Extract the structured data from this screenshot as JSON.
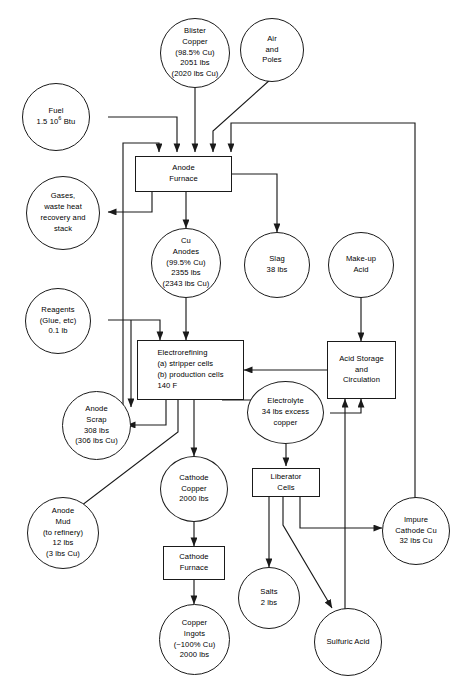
{
  "diagram": {
    "stroke_color": "#1a1a1a",
    "background_color": "#ffffff"
  },
  "nodes": {
    "blister_copper": {
      "label": "Blister\nCopper\n(98.5% Cu)\n2051 lbs\n(2020 lbs Cu)",
      "shape": "circle"
    },
    "air_and_poles": {
      "label": "Air\nand\nPoles",
      "shape": "circle"
    },
    "fuel": {
      "label_line1": "Fuel",
      "label_line2_pre": "1.5 10",
      "label_line2_sup": "6",
      "label_line2_post": " Btu",
      "shape": "circle"
    },
    "gases_waste_heat": {
      "label": "Gases,\nwaste heat\nrecovery and\nstack",
      "shape": "circle"
    },
    "anode_furnace": {
      "label": "Anode\nFurnace",
      "shape": "box"
    },
    "cu_anodes": {
      "label": "Cu\nAnodes\n(99.5% Cu)\n2355 lbs\n(2343 lbs Cu)",
      "shape": "circle"
    },
    "slag": {
      "label": "Slag\n38 lbs",
      "shape": "circle"
    },
    "make_up_acid": {
      "label": "Make-up\nAcid",
      "shape": "circle"
    },
    "reagents": {
      "label": "Reagents\n(Glue, etc)\n0.1 lb",
      "shape": "circle"
    },
    "electrorefining": {
      "label": "Electrorefining\n(a)  stripper cells\n(b)  production cells\n140 F",
      "shape": "box"
    },
    "acid_storage": {
      "label": "Acid Storage\nand\nCirculation",
      "shape": "box"
    },
    "anode_scrap": {
      "label": "Anode\nScrap\n308 lbs\n(306 lbs Cu)",
      "shape": "circle"
    },
    "electrolyte": {
      "label": "Electrolyte\n34 lbs excess\ncopper",
      "shape": "circle"
    },
    "cathode_copper": {
      "label": "Cathode\nCopper\n2000 lbs",
      "shape": "circle"
    },
    "liberator_cells": {
      "label": "Liberator\nCells",
      "shape": "box"
    },
    "anode_mud": {
      "label": "Anode\nMud\n(to refinery)\n12 lbs\n(3 lbs Cu)",
      "shape": "circle"
    },
    "impure_cathode_cu": {
      "label": "Impure\nCathode Cu\n32 lbs Cu",
      "shape": "circle"
    },
    "cathode_furnace": {
      "label": "Cathode\nFurnace",
      "shape": "box"
    },
    "salts": {
      "label": "Salts\n2 lbs",
      "shape": "circle"
    },
    "copper_ingots": {
      "label": "Copper\nIngots\n(~100% Cu)\n2000 lbs",
      "shape": "circle"
    },
    "sulfuric_acid": {
      "label": "Sulfuric Acid",
      "shape": "circle"
    }
  },
  "edges": [
    {
      "from": "blister_copper",
      "to": "anode_furnace"
    },
    {
      "from": "air_and_poles",
      "to": "anode_furnace"
    },
    {
      "from": "fuel",
      "to": "anode_furnace"
    },
    {
      "from": "anode_furnace",
      "to": "gases_waste_heat"
    },
    {
      "from": "anode_furnace",
      "to": "cu_anodes"
    },
    {
      "from": "anode_furnace",
      "to": "slag"
    },
    {
      "from": "cu_anodes",
      "to": "electrorefining"
    },
    {
      "from": "reagents",
      "to": "electrorefining"
    },
    {
      "from": "reagents",
      "to": "anode_scrap"
    },
    {
      "from": "make_up_acid",
      "to": "acid_storage"
    },
    {
      "from": "acid_storage",
      "to": "electrorefining"
    },
    {
      "from": "electrorefining",
      "to": "anode_scrap"
    },
    {
      "from": "electrorefining",
      "to": "electrolyte"
    },
    {
      "from": "electrorefining",
      "to": "cathode_copper"
    },
    {
      "from": "electrorefining",
      "to": "anode_mud"
    },
    {
      "from": "electrolyte",
      "to": "acid_storage"
    },
    {
      "from": "electrolyte",
      "to": "liberator_cells"
    },
    {
      "from": "anode_scrap",
      "to": "anode_furnace"
    },
    {
      "from": "liberator_cells",
      "to": "salts"
    },
    {
      "from": "liberator_cells",
      "to": "sulfuric_acid"
    },
    {
      "from": "liberator_cells",
      "to": "impure_cathode_cu"
    },
    {
      "from": "impure_cathode_cu",
      "to": "anode_furnace"
    },
    {
      "from": "sulfuric_acid",
      "to": "acid_storage"
    },
    {
      "from": "cathode_copper",
      "to": "cathode_furnace"
    },
    {
      "from": "cathode_furnace",
      "to": "copper_ingots"
    }
  ]
}
